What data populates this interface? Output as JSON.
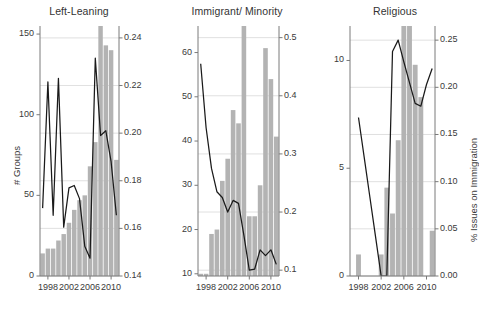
{
  "figure": {
    "width": 474,
    "height": 322,
    "bar_color": "#b3b3b3",
    "line_color": "#1a1a1a",
    "grid_color": "#d8d8d8",
    "axis_color": "#7a7a7a",
    "text_color": "#3a3a3a",
    "left_axis_label": "# Groups",
    "right_axis_label": "% Issues on Immigration"
  },
  "chart_data": [
    {
      "type": "bar",
      "title": "Left-Leaning",
      "xlabel": "",
      "ylabel": "# Groups",
      "y2label": "",
      "xlim": [
        1996.5,
        2011.5
      ],
      "ylim": [
        0,
        155
      ],
      "y2lim": [
        0.14,
        0.245
      ],
      "grid": true,
      "xticks": [
        1998,
        2002,
        2006,
        2010
      ],
      "yticks": [
        0,
        50,
        100,
        150
      ],
      "y2ticks": [
        0.14,
        0.16,
        0.18,
        0.2,
        0.22,
        0.24
      ],
      "y2ticklabels": [
        "0.14",
        "0.16",
        "0.18",
        "0.20",
        "0.22",
        "0.24"
      ],
      "x": [
        1997,
        1998,
        1999,
        2000,
        2001,
        2002,
        2003,
        2004,
        2005,
        2006,
        2007,
        2008,
        2009,
        2010,
        2011
      ],
      "bars": [
        14,
        17,
        17,
        22,
        26,
        33,
        41,
        47,
        50,
        68,
        83,
        155,
        143,
        140,
        72
      ],
      "series": [
        {
          "name": "% Issues on Immigration",
          "axis": "right",
          "x": [
            1997,
            1998,
            1999,
            2000,
            2001,
            2002,
            2003,
            2004,
            2005,
            2006,
            2007,
            2008,
            2009,
            2010,
            2011
          ],
          "values": [
            0.1685,
            0.2215,
            0.1655,
            0.223,
            0.1605,
            0.177,
            0.178,
            0.1725,
            0.1525,
            0.1475,
            0.2315,
            0.199,
            0.201,
            0.188,
            0.1655
          ]
        }
      ]
    },
    {
      "type": "bar",
      "title": "Immigrant/ Minority",
      "xlabel": "",
      "ylabel": "",
      "y2label": "",
      "xlim": [
        1996.5,
        2011.5
      ],
      "ylim": [
        9.5,
        66
      ],
      "y2lim": [
        0.09,
        0.52
      ],
      "grid": true,
      "xticks": [
        1998,
        2002,
        2006,
        2010
      ],
      "yticks": [
        10,
        20,
        30,
        40,
        50,
        60
      ],
      "y2ticks": [
        0.1,
        0.2,
        0.3,
        0.4,
        0.5
      ],
      "y2ticklabels": [
        "0.1",
        "0.2",
        "0.3",
        "0.4",
        "0.5"
      ],
      "x": [
        1997,
        1998,
        1999,
        2000,
        2001,
        2002,
        2003,
        2004,
        2005,
        2006,
        2007,
        2008,
        2009,
        2010,
        2011
      ],
      "bars": [
        10,
        10,
        19,
        20,
        31,
        36,
        47,
        44,
        66,
        23,
        23,
        30,
        61,
        54,
        41
      ],
      "series": [
        {
          "name": "% Issues on Immigration",
          "axis": "right",
          "x": [
            1997,
            1998,
            1999,
            2000,
            2001,
            2002,
            2003,
            2004,
            2005,
            2006,
            2007,
            2008,
            2009,
            2010,
            2011
          ],
          "values": [
            0.455,
            0.345,
            0.275,
            0.235,
            0.225,
            0.2,
            0.22,
            0.215,
            0.16,
            0.1,
            0.102,
            0.135,
            0.125,
            0.135,
            0.11
          ]
        }
      ]
    },
    {
      "type": "bar",
      "title": "Religious",
      "xlabel": "",
      "ylabel": "",
      "y2label": "% Issues on Immigration",
      "xlim": [
        1996.5,
        2011.5
      ],
      "ylim": [
        0,
        11.6
      ],
      "y2lim": [
        0.0,
        0.265
      ],
      "grid": true,
      "xticks": [
        1998,
        2002,
        2006,
        2010
      ],
      "yticks": [
        0,
        5,
        10
      ],
      "y2ticks": [
        0.0,
        0.05,
        0.1,
        0.15,
        0.2,
        0.25
      ],
      "y2ticklabels": [
        "0.00",
        "0.05",
        "0.10",
        "0.15",
        "0.20",
        "0.25"
      ],
      "x": [
        1997,
        1998,
        1999,
        2000,
        2001,
        2002,
        2003,
        2004,
        2005,
        2006,
        2007,
        2008,
        2009,
        2010,
        2011
      ],
      "bars": [
        0,
        1,
        0,
        0,
        0,
        1,
        4.1,
        2.9,
        6.3,
        11.6,
        11.6,
        9.8,
        8.3,
        0,
        2.1
      ],
      "series": [
        {
          "name": "% Issues on Immigration",
          "axis": "right",
          "x": [
            1998,
            1999,
            2000,
            2001,
            2002,
            2003,
            2004,
            2005,
            2006,
            2007,
            2008,
            2009,
            2010,
            2011
          ],
          "values": [
            0.168,
            0.126,
            0.084,
            0.042,
            0.0,
            0.0,
            0.238,
            0.25,
            0.227,
            0.205,
            0.183,
            0.18,
            0.203,
            0.22
          ]
        }
      ]
    }
  ]
}
